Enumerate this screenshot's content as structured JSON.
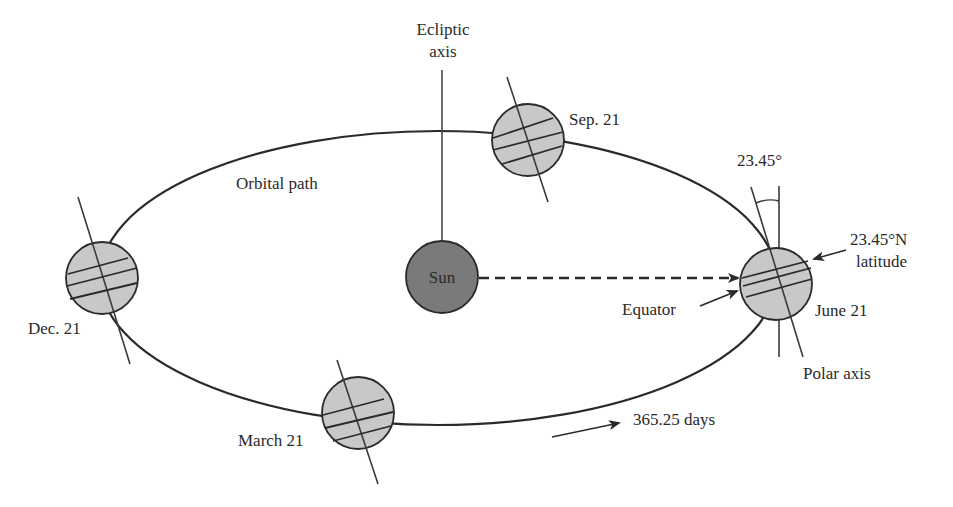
{
  "diagram": {
    "type": "earth-orbit-seasons",
    "colors": {
      "background": "#ffffff",
      "line": "#2a2a2a",
      "earth_fill": "#c8c8c8",
      "sun_fill": "#7a7a7a",
      "text": "#2a2a2a"
    },
    "labels": {
      "ecliptic_axis_line1": "Ecliptic",
      "ecliptic_axis_line2": "axis",
      "orbital_path": "Orbital path",
      "sun": "Sun",
      "tilt_angle": "23.45°",
      "latitude_line1": "23.45°N",
      "latitude_line2": "latitude",
      "equator": "Equator",
      "polar_axis": "Polar axis",
      "period": "365.25 days"
    },
    "positions": [
      {
        "name": "Sep. 21"
      },
      {
        "name": "Dec. 21"
      },
      {
        "name": "March 21"
      },
      {
        "name": "June 21"
      }
    ]
  }
}
